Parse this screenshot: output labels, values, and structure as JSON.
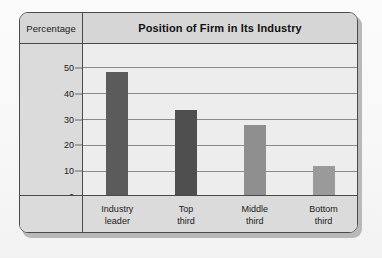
{
  "figure": {
    "axis_header_label": "Percentage",
    "title": "Position of Firm in Its Industry"
  },
  "colors": {
    "frame_border": "#4a4a4a",
    "header_band": "#d6d6d6",
    "label_band": "#dbdbdb",
    "plot_background": "#ededed",
    "gridline": "#8a8a8a",
    "bar_dark": "#5b5b5b",
    "bar_light": "#9a9a9a"
  },
  "chart_data": {
    "type": "bar",
    "title": "Position of Firm in Its Industry",
    "xlabel": "",
    "ylabel": "Percentage",
    "categories": [
      "Industry leader",
      "Top third",
      "Middle third",
      "Bottom third"
    ],
    "category_lines": [
      [
        "Industry",
        "leader"
      ],
      [
        "Top",
        "third"
      ],
      [
        "Middle",
        "third"
      ],
      [
        "Bottom",
        "third"
      ]
    ],
    "values": [
      48,
      33.5,
      27.5,
      11.5
    ],
    "bar_colors": [
      "#5b5b5b",
      "#4f4f4f",
      "#8f8f8f",
      "#9a9a9a"
    ],
    "ylim": [
      0,
      55
    ],
    "yticks": [
      0,
      10,
      20,
      30,
      40,
      50
    ],
    "ytick_labels": [
      "0",
      "10",
      "20",
      "30",
      "40",
      "50"
    ],
    "grid": true,
    "grid_axis": "y",
    "legend": false
  }
}
